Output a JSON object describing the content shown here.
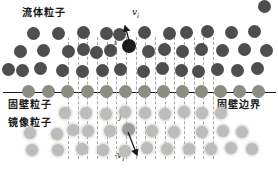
{
  "figure": {
    "labels": {
      "fluid_particles": "流体粒子",
      "wall_particles": "固壁粒子",
      "mirror_particles": "镜像粒子",
      "wall_boundary": "固壁边界",
      "particle_i": "i",
      "particle_j": "j",
      "velocity_i": {
        "sign": "",
        "symbol": "v",
        "subscript": "i"
      },
      "velocity_j": {
        "sign": "-",
        "symbol": "v",
        "subscript": "i"
      }
    },
    "colors": {
      "fluid": "#4e4e4c",
      "fluid_highlight": "#1c1c1c",
      "wall": "#8d8d82",
      "mirror": "#bcbcba",
      "mirror_highlight": "#9d9d9b",
      "boundary_line": "#1a1a1a",
      "dash": "#9a9a96",
      "text": "#1a1a1a",
      "background": "#ffffff"
    },
    "boundary_line": {
      "x1": 3,
      "x2": 276,
      "y": 92
    },
    "dashed_lines": {
      "y_top": 37,
      "y_bottom": 159,
      "x_positions": [
        68,
        78,
        87,
        97,
        107,
        116,
        126,
        136,
        145,
        155,
        165,
        174,
        184,
        194,
        203,
        213
      ]
    },
    "sizes": {
      "fluid_d": 13,
      "wall_d": 13,
      "mirror_d": 12,
      "i_d": 14,
      "j_d": 13
    },
    "particles": {
      "fluid": [
        [
          33,
          33
        ],
        [
          58,
          33
        ],
        [
          83,
          32
        ],
        [
          106,
          33
        ],
        [
          119,
          34
        ],
        [
          144,
          32
        ],
        [
          169,
          33
        ],
        [
          186,
          32
        ],
        [
          207,
          31
        ],
        [
          231,
          32
        ],
        [
          254,
          31
        ],
        [
          264,
          6
        ],
        [
          20,
          51
        ],
        [
          43,
          50
        ],
        [
          68,
          51
        ],
        [
          83,
          49
        ],
        [
          96,
          52
        ],
        [
          110,
          50
        ],
        [
          148,
          51
        ],
        [
          164,
          49
        ],
        [
          182,
          51
        ],
        [
          201,
          49
        ],
        [
          222,
          50
        ],
        [
          244,
          49
        ],
        [
          266,
          50
        ],
        [
          8,
          69
        ],
        [
          22,
          70
        ],
        [
          40,
          68
        ],
        [
          62,
          70
        ],
        [
          82,
          71
        ],
        [
          102,
          70
        ],
        [
          120,
          69
        ],
        [
          143,
          71
        ],
        [
          162,
          68
        ],
        [
          181,
          70
        ],
        [
          198,
          71
        ],
        [
          217,
          69
        ],
        [
          237,
          70
        ],
        [
          257,
          68
        ]
      ],
      "wall": [
        [
          28,
          91
        ],
        [
          48,
          91
        ],
        [
          67,
          91
        ],
        [
          87,
          91
        ],
        [
          106,
          91
        ],
        [
          125,
          91
        ],
        [
          144,
          91
        ],
        [
          163,
          91
        ],
        [
          182,
          91
        ],
        [
          201,
          91
        ],
        [
          220,
          91
        ],
        [
          239,
          91
        ],
        [
          258,
          91
        ]
      ],
      "mirror": [
        [
          65,
          113
        ],
        [
          86,
          113
        ],
        [
          106,
          114
        ],
        [
          125,
          112
        ],
        [
          145,
          113
        ],
        [
          165,
          114
        ],
        [
          184,
          112
        ],
        [
          202,
          113
        ],
        [
          221,
          113
        ],
        [
          30,
          133
        ],
        [
          57,
          134
        ],
        [
          73,
          130
        ],
        [
          88,
          131
        ],
        [
          110,
          131
        ],
        [
          152,
          131
        ],
        [
          174,
          132
        ],
        [
          202,
          132
        ],
        [
          223,
          131
        ],
        [
          242,
          132
        ],
        [
          32,
          150
        ],
        [
          58,
          150
        ],
        [
          82,
          149
        ],
        [
          103,
          150
        ],
        [
          125,
          151
        ],
        [
          147,
          148
        ],
        [
          167,
          149
        ],
        [
          189,
          149
        ],
        [
          211,
          149
        ],
        [
          231,
          148
        ],
        [
          252,
          149
        ]
      ],
      "i": [
        129,
        46
      ],
      "j": [
        128,
        129
      ]
    },
    "arrows": {
      "vi": {
        "x1": 130,
        "y1": 44,
        "x2": 125,
        "y2": 26
      },
      "neg_vi": {
        "x1": 128,
        "y1": 132,
        "x2": 137,
        "y2": 155
      }
    }
  }
}
